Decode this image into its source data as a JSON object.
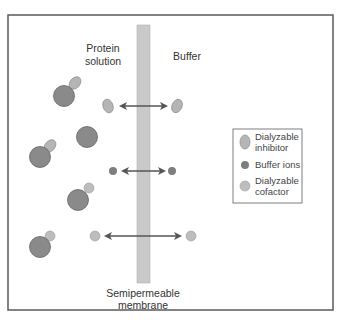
{
  "diagram": {
    "labels": {
      "protein_solution_line1": "Protein",
      "protein_solution_line2": "solution",
      "buffer": "Buffer",
      "membrane_line1": "Semipermeable",
      "membrane_line2": "membrane"
    },
    "legend": {
      "items": [
        {
          "name": "inhibitor",
          "line1": "Dialyzable",
          "line2": "inhibitor"
        },
        {
          "name": "buffer-ions",
          "line1": "Buffer ions",
          "line2": ""
        },
        {
          "name": "cofactor",
          "line1": "Dialyzable",
          "line2": "cofactor"
        }
      ]
    },
    "colors": {
      "protein": "#8a8a8a",
      "inhibitor": "#b5b5b5",
      "buffer_ion": "#7e7e7e",
      "cofactor": "#bdbdbd",
      "membrane": "#c9c9c9",
      "arrow": "#555555",
      "border": "#555555"
    }
  }
}
